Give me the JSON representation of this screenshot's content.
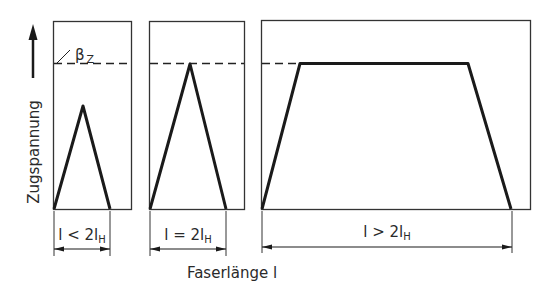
{
  "diagram": {
    "y_axis_label": "Zugspannung",
    "x_axis_label": "Faserlänge l",
    "strength_label": "β",
    "strength_subscript": "Z",
    "panels": [
      {
        "id": "short",
        "label_main": "l < 2l",
        "label_sub": "H",
        "shape": "triangle",
        "peak_relative": 0.71
      },
      {
        "id": "critical",
        "label_main": "l = 2l",
        "label_sub": "H",
        "shape": "triangle",
        "peak_relative": 1.0
      },
      {
        "id": "long",
        "label_main": "l > 2l",
        "label_sub": "H",
        "shape": "trapezoid",
        "peak_relative": 1.0
      }
    ],
    "colors": {
      "line": "#1a1a1a",
      "frame": "#333333",
      "background": "#ffffff"
    }
  }
}
